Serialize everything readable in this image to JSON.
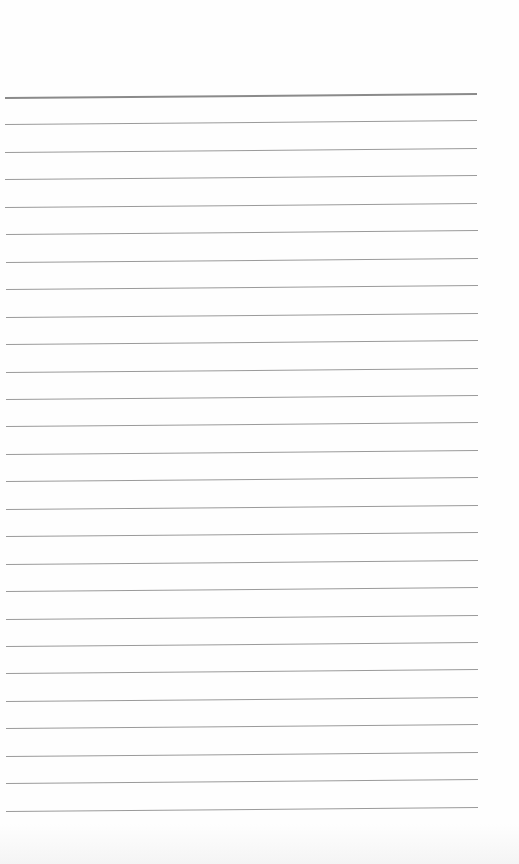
{
  "page": {
    "type": "lined-paper",
    "background_color": "#fefefe",
    "rule_color": "#9a9a9a",
    "rule_count": 27,
    "first_rule_y": 97,
    "rule_spacing": 27.4,
    "rule_left_x": 5,
    "rule_width": 472
  }
}
